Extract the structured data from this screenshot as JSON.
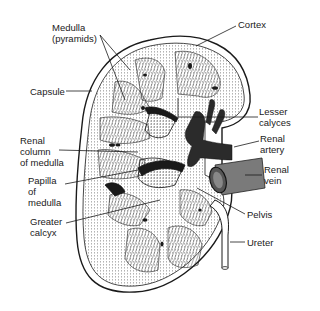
{
  "diagram": {
    "colors": {
      "background": "#ffffff",
      "ink": "#1a1a1a",
      "renal_vein": "#7a7a7a",
      "renal_artery": "#2b2b2b"
    },
    "labels": {
      "medulla": "Medulla\n(pyramids)",
      "cortex": "Cortex",
      "capsule": "Capsule",
      "lesser_calyces": "Lesser\ncalyces",
      "renal_column": "Renal\ncolumn\nof medulla",
      "renal_artery": "Renal\nartery",
      "papilla": "Papilla\nof\nmedulla",
      "renal_vein": "Renal\nvein",
      "greater_calyx": "Greater\ncalcyx",
      "pelvis": "Pelvis",
      "ureter": "Ureter"
    }
  }
}
